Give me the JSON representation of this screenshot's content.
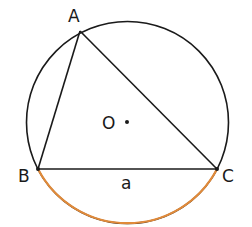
{
  "diagram": {
    "type": "inscribed-triangle-in-circle",
    "colors": {
      "stroke": "#1a1a1a",
      "arc_highlight": "#e08a3a",
      "background": "#ffffff"
    },
    "circle": {
      "center_label": "O",
      "cx": 127,
      "cy": 122,
      "r": 101
    },
    "points": {
      "A": {
        "label": "A",
        "x": 80,
        "y": 31
      },
      "B": {
        "label": "B",
        "x": 38,
        "y": 169
      },
      "C": {
        "label": "C",
        "x": 217,
        "y": 169
      }
    },
    "side_label": "a",
    "highlighted_arc": "BC (minor arc, below chord)"
  }
}
